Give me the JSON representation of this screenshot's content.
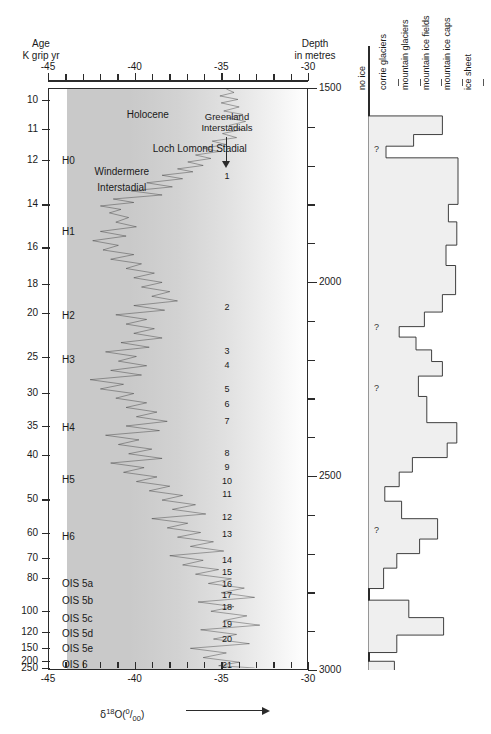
{
  "figure": {
    "left_axis_title_line1": "Age",
    "left_axis_title_line2": "K grip yr",
    "right_axis_title_line1": "Depth",
    "right_axis_title_line2": "in metres",
    "bottom_axis_label": "δ18O(0/oo)",
    "interstadial_header_line1": "Greenland",
    "interstadial_header_line2": "Interstadials"
  },
  "chart_data": {
    "type": "line",
    "xlabel": "δ18O(0/oo)",
    "ylabel": "Age K grip yr",
    "xlim": [
      -45,
      -30
    ],
    "ylim_depth": [
      1500,
      3000
    ],
    "grid": false,
    "x_major_ticks": [
      "-45",
      "-40",
      "-35",
      "-30"
    ],
    "x_major_values": [
      -45,
      -40,
      -35,
      -30
    ],
    "x_minor_step": 1,
    "age_ticks": [
      "10",
      "11",
      "12",
      "14",
      "16",
      "18",
      "20",
      "25",
      "30",
      "35",
      "40",
      "50",
      "60",
      "70",
      "80",
      "100",
      "120",
      "150",
      "200",
      "250"
    ],
    "age_tick_values": [
      10,
      11,
      12,
      14,
      16,
      18,
      20,
      25,
      30,
      35,
      40,
      50,
      60,
      70,
      80,
      100,
      120,
      150,
      200,
      250
    ],
    "age_tick_positions_pct": [
      2.1,
      7.0,
      12.3,
      20.0,
      27.4,
      33.7,
      38.6,
      46.2,
      52.4,
      58.0,
      63.0,
      70.7,
      76.5,
      80.8,
      84.2,
      89.9,
      93.4,
      96.2,
      98.4,
      99.6
    ],
    "depth_major_ticks": [
      "1500",
      "2000",
      "2500",
      "3000"
    ],
    "depth_major_values": [
      1500,
      2000,
      2500,
      3000
    ],
    "depth_minor_step": 100,
    "series": [
      {
        "name": "δ18O (GRIP)",
        "points_pct": [
          [
            0.0,
            69.0
          ],
          [
            0.6,
            72.0
          ],
          [
            1.2,
            66.5
          ],
          [
            1.8,
            73.5
          ],
          [
            2.4,
            67.0
          ],
          [
            3.1,
            74.0
          ],
          [
            3.8,
            68.0
          ],
          [
            4.4,
            75.5
          ],
          [
            5.0,
            69.5
          ],
          [
            5.6,
            76.5
          ],
          [
            6.3,
            70.0
          ],
          [
            7.0,
            75.0
          ],
          [
            7.7,
            67.5
          ],
          [
            8.4,
            73.0
          ],
          [
            9.0,
            63.5
          ],
          [
            9.6,
            69.0
          ],
          [
            10.2,
            60.0
          ],
          [
            10.8,
            66.0
          ],
          [
            11.4,
            57.0
          ],
          [
            12.0,
            63.0
          ],
          [
            12.6,
            54.0
          ],
          [
            13.2,
            60.0
          ],
          [
            13.8,
            50.0
          ],
          [
            14.3,
            56.0
          ],
          [
            14.9,
            44.0
          ],
          [
            15.5,
            52.0
          ],
          [
            16.2,
            38.0
          ],
          [
            16.9,
            48.0
          ],
          [
            17.6,
            32.0
          ],
          [
            18.3,
            44.0
          ],
          [
            19.0,
            25.0
          ],
          [
            19.6,
            33.0
          ],
          [
            20.2,
            20.0
          ],
          [
            20.8,
            28.0
          ],
          [
            21.4,
            23.5
          ],
          [
            22.2,
            31.0
          ],
          [
            23.0,
            26.0
          ],
          [
            23.8,
            34.0
          ],
          [
            24.6,
            20.0
          ],
          [
            25.4,
            30.0
          ],
          [
            26.2,
            17.0
          ],
          [
            27.0,
            27.0
          ],
          [
            27.8,
            21.0
          ],
          [
            28.6,
            33.0
          ],
          [
            29.4,
            24.0
          ],
          [
            30.2,
            36.0
          ],
          [
            31.0,
            30.0
          ],
          [
            31.8,
            41.0
          ],
          [
            32.6,
            33.0
          ],
          [
            33.4,
            44.0
          ],
          [
            34.2,
            36.0
          ],
          [
            35.0,
            47.0
          ],
          [
            35.8,
            40.0
          ],
          [
            36.6,
            50.0
          ],
          [
            37.4,
            33.0
          ],
          [
            38.2,
            45.0
          ],
          [
            39.0,
            26.0
          ],
          [
            39.8,
            38.0
          ],
          [
            40.6,
            30.0
          ],
          [
            41.4,
            41.0
          ],
          [
            42.2,
            33.0
          ],
          [
            43.0,
            44.0
          ],
          [
            43.8,
            28.0
          ],
          [
            44.6,
            39.0
          ],
          [
            45.4,
            22.0
          ],
          [
            46.2,
            34.0
          ],
          [
            47.0,
            27.0
          ],
          [
            47.8,
            38.0
          ],
          [
            48.6,
            24.0
          ],
          [
            49.4,
            36.0
          ],
          [
            50.2,
            16.0
          ],
          [
            51.0,
            29.0
          ],
          [
            51.8,
            20.0
          ],
          [
            52.6,
            33.0
          ],
          [
            53.4,
            26.0
          ],
          [
            54.2,
            38.0
          ],
          [
            55.0,
            30.0
          ],
          [
            55.8,
            42.0
          ],
          [
            56.6,
            34.0
          ],
          [
            57.4,
            46.0
          ],
          [
            58.2,
            30.0
          ],
          [
            59.0,
            43.0
          ],
          [
            59.8,
            22.0
          ],
          [
            60.6,
            35.0
          ],
          [
            61.4,
            27.0
          ],
          [
            62.2,
            40.0
          ],
          [
            63.0,
            31.0
          ],
          [
            63.8,
            44.0
          ],
          [
            64.6,
            24.0
          ],
          [
            65.4,
            37.0
          ],
          [
            66.2,
            29.0
          ],
          [
            67.0,
            42.0
          ],
          [
            67.8,
            34.0
          ],
          [
            68.6,
            47.0
          ],
          [
            69.4,
            39.0
          ],
          [
            70.2,
            52.0
          ],
          [
            71.0,
            44.0
          ],
          [
            71.8,
            57.0
          ],
          [
            72.6,
            48.0
          ],
          [
            73.4,
            61.0
          ],
          [
            74.2,
            40.0
          ],
          [
            75.0,
            54.0
          ],
          [
            75.8,
            46.0
          ],
          [
            76.6,
            59.0
          ],
          [
            77.4,
            50.0
          ],
          [
            78.2,
            64.0
          ],
          [
            79.0,
            55.0
          ],
          [
            79.8,
            68.0
          ],
          [
            80.6,
            47.0
          ],
          [
            81.4,
            60.0
          ],
          [
            82.2,
            52.0
          ],
          [
            83.0,
            66.0
          ],
          [
            83.8,
            57.0
          ],
          [
            84.6,
            71.0
          ],
          [
            85.4,
            62.0
          ],
          [
            86.2,
            76.0
          ],
          [
            87.0,
            67.0
          ],
          [
            87.8,
            80.0
          ],
          [
            88.6,
            58.0
          ],
          [
            89.4,
            72.0
          ],
          [
            90.2,
            63.0
          ],
          [
            91.0,
            77.0
          ],
          [
            91.8,
            68.0
          ],
          [
            92.6,
            82.0
          ],
          [
            93.4,
            59.0
          ],
          [
            94.2,
            73.0
          ],
          [
            95.0,
            64.0
          ],
          [
            95.8,
            78.0
          ],
          [
            96.6,
            55.0
          ],
          [
            97.4,
            69.0
          ],
          [
            98.2,
            60.0
          ],
          [
            99.0,
            74.0
          ],
          [
            99.6,
            66.0
          ],
          [
            100.0,
            80.0
          ]
        ]
      }
    ],
    "stadial_labels": [
      {
        "label": "H0",
        "y_pct": 12.3
      },
      {
        "label": "H1",
        "y_pct": 24.6
      },
      {
        "label": "H2",
        "y_pct": 39.0
      },
      {
        "label": "H3",
        "y_pct": 46.5
      },
      {
        "label": "H4",
        "y_pct": 58.2
      },
      {
        "label": "H5",
        "y_pct": 67.1
      },
      {
        "label": "H6",
        "y_pct": 77.0
      },
      {
        "label": "OIS 5a",
        "y_pct": 85.0
      },
      {
        "label": "OIS 5b",
        "y_pct": 88.0
      },
      {
        "label": "OIS 5c",
        "y_pct": 91.0
      },
      {
        "label": "OIS 5d",
        "y_pct": 93.7
      },
      {
        "label": "OIS 5e",
        "y_pct": 96.3
      },
      {
        "label": "OIS 6",
        "y_pct": 99.0
      },
      {
        "label": "OIS 7",
        "y_pct": 101.5
      }
    ],
    "event_labels": [
      {
        "label": "Holocene",
        "x_pct": 38,
        "y_pct": 4.5
      },
      {
        "label": "Loch Lomond Stadial",
        "x_pct": 58,
        "y_pct": 10.3
      },
      {
        "label": "Windermere",
        "x_pct": 28,
        "y_pct": 14.3
      },
      {
        "label": "Interstadial",
        "x_pct": 28,
        "y_pct": 17.0
      }
    ],
    "interstadials": [
      {
        "n": "1",
        "y_pct": 15.0
      },
      {
        "n": "2",
        "y_pct": 37.5
      },
      {
        "n": "3",
        "y_pct": 45.0
      },
      {
        "n": "4",
        "y_pct": 47.5
      },
      {
        "n": "5",
        "y_pct": 51.5
      },
      {
        "n": "6",
        "y_pct": 54.2
      },
      {
        "n": "7",
        "y_pct": 57.0
      },
      {
        "n": "8",
        "y_pct": 62.5
      },
      {
        "n": "9",
        "y_pct": 65.0
      },
      {
        "n": "10",
        "y_pct": 67.4
      },
      {
        "n": "11",
        "y_pct": 69.6
      },
      {
        "n": "12",
        "y_pct": 73.5
      },
      {
        "n": "13",
        "y_pct": 76.5
      },
      {
        "n": "14",
        "y_pct": 81.0
      },
      {
        "n": "15",
        "y_pct": 83.0
      },
      {
        "n": "16",
        "y_pct": 85.0
      },
      {
        "n": "17",
        "y_pct": 87.0
      },
      {
        "n": "18",
        "y_pct": 89.0
      },
      {
        "n": "19",
        "y_pct": 92.0
      },
      {
        "n": "20",
        "y_pct": 94.5
      },
      {
        "n": "21",
        "y_pct": 99.0
      },
      {
        "n": "22",
        "y_pct": 101.5
      },
      {
        "n": "23",
        "y_pct": 105.5
      },
      {
        "n": "24",
        "y_pct": 107.5
      }
    ]
  },
  "ice_panel": {
    "columns": [
      {
        "label": "no ice",
        "x_pct": 0
      },
      {
        "label": "corrie glaciers",
        "x_pct": 18
      },
      {
        "label": "mountain glaciers",
        "x_pct": 36
      },
      {
        "label": "mountain ice fields",
        "x_pct": 54
      },
      {
        "label": "mountain ice caps",
        "x_pct": 72
      },
      {
        "label": "ice sheet",
        "x_pct": 90
      }
    ],
    "uncertainty_marks": [
      {
        "label": "?",
        "y_pct": 10.5
      },
      {
        "label": "?",
        "y_pct": 41.0
      },
      {
        "label": "?",
        "y_pct": 51.5
      },
      {
        "label": "?",
        "y_pct": 76.0
      }
    ],
    "steps_pct": [
      {
        "y0": 0.0,
        "y1": 4.8,
        "w": 0
      },
      {
        "y0": 4.8,
        "y1": 8.0,
        "w": 62
      },
      {
        "y0": 8.0,
        "y1": 10.0,
        "w": 38
      },
      {
        "y0": 10.0,
        "y1": 12.0,
        "w": 15
      },
      {
        "y0": 12.0,
        "y1": 20.0,
        "w": 75
      },
      {
        "y0": 20.0,
        "y1": 23.0,
        "w": 67
      },
      {
        "y0": 23.0,
        "y1": 27.0,
        "w": 74
      },
      {
        "y0": 27.0,
        "y1": 30.5,
        "w": 65
      },
      {
        "y0": 30.5,
        "y1": 35.5,
        "w": 73
      },
      {
        "y0": 35.5,
        "y1": 38.5,
        "w": 62
      },
      {
        "y0": 38.5,
        "y1": 41.0,
        "w": 47
      },
      {
        "y0": 41.0,
        "y1": 42.8,
        "w": 26
      },
      {
        "y0": 42.8,
        "y1": 45.0,
        "w": 40
      },
      {
        "y0": 45.0,
        "y1": 47.0,
        "w": 53
      },
      {
        "y0": 47.0,
        "y1": 49.5,
        "w": 62
      },
      {
        "y0": 49.5,
        "y1": 53.0,
        "w": 42
      },
      {
        "y0": 53.0,
        "y1": 57.5,
        "w": 49
      },
      {
        "y0": 57.5,
        "y1": 61.0,
        "w": 74
      },
      {
        "y0": 61.0,
        "y1": 63.5,
        "w": 66
      },
      {
        "y0": 63.5,
        "y1": 66.0,
        "w": 37
      },
      {
        "y0": 66.0,
        "y1": 68.5,
        "w": 26
      },
      {
        "y0": 68.5,
        "y1": 71.0,
        "w": 14
      },
      {
        "y0": 71.0,
        "y1": 74.0,
        "w": 28
      },
      {
        "y0": 74.0,
        "y1": 77.5,
        "w": 58
      },
      {
        "y0": 77.5,
        "y1": 80.0,
        "w": 43
      },
      {
        "y0": 80.0,
        "y1": 82.5,
        "w": 24
      },
      {
        "y0": 82.5,
        "y1": 86.0,
        "w": 13
      },
      {
        "y0": 86.0,
        "y1": 88.0,
        "w": 0
      },
      {
        "y0": 88.0,
        "y1": 91.0,
        "w": 34
      },
      {
        "y0": 91.0,
        "y1": 94.0,
        "w": 63
      },
      {
        "y0": 94.0,
        "y1": 97.0,
        "w": 24
      },
      {
        "y0": 97.0,
        "y1": 98.5,
        "w": 0
      },
      {
        "y0": 98.5,
        "y1": 101.0,
        "w": 22
      }
    ]
  }
}
